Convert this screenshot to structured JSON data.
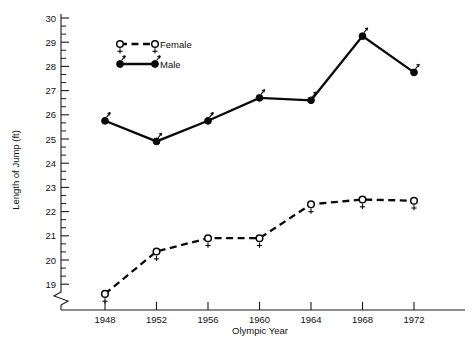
{
  "chart_data": {
    "type": "line",
    "title": "",
    "xlabel": "Olympic Year",
    "ylabel": "Length of Jump (ft)",
    "categories": [
      "1948",
      "1952",
      "1956",
      "1960",
      "1964",
      "1968",
      "1972"
    ],
    "x": [
      1948,
      1952,
      1956,
      1960,
      1964,
      1968,
      1972
    ],
    "xlim": [
      1946,
      1974
    ],
    "ylim": [
      18.4,
      30
    ],
    "yticks": [
      19,
      20,
      21,
      22,
      23,
      24,
      25,
      26,
      27,
      28,
      29,
      30
    ],
    "ytick_labels": [
      "19",
      "20",
      "21",
      "22",
      "23",
      "24",
      "25",
      "26",
      "27",
      "28",
      "29",
      "30"
    ],
    "y_minor_ticks_per_interval": 2,
    "y_axis_break": true,
    "grid": false,
    "legend_position": "upper-left-inside",
    "series": [
      {
        "name": "Male",
        "marker": "filled-circle",
        "line_style": "solid",
        "color": "#0a0a0a",
        "values": [
          25.75,
          24.9,
          25.75,
          26.7,
          26.6,
          29.25,
          27.75
        ]
      },
      {
        "name": "Female",
        "marker": "open-circle",
        "line_style": "dashed",
        "color": "#0a0a0a",
        "values": [
          18.6,
          20.35,
          20.9,
          20.9,
          22.3,
          22.5,
          22.45
        ]
      }
    ],
    "legend_entries": [
      {
        "label": "Female",
        "marker": "open-circle",
        "line_style": "dashed"
      },
      {
        "label": "Male",
        "marker": "filled-circle",
        "line_style": "solid"
      }
    ]
  }
}
